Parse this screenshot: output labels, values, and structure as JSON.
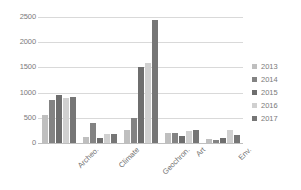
{
  "chart_data": {
    "type": "bar",
    "title": "",
    "subtitle": "",
    "xlabel": "",
    "ylabel": "",
    "categories": [
      "Archeo.",
      "Climate",
      "Geochron.",
      "Art",
      "Env."
    ],
    "series": [
      {
        "name": "2013",
        "color": "#bfbfbf",
        "values": [
          550,
          120,
          250,
          190,
          70
        ]
      },
      {
        "name": "2014",
        "color": "#838383",
        "values": [
          850,
          400,
          500,
          190,
          60
        ]
      },
      {
        "name": "2015",
        "color": "#6e6e6e",
        "values": [
          950,
          90,
          1500,
          130,
          90
        ]
      },
      {
        "name": "2016",
        "color": "#d0d0d0",
        "values": [
          900,
          170,
          1580,
          230,
          250
        ]
      },
      {
        "name": "2017",
        "color": "#767676",
        "values": [
          920,
          180,
          2450,
          250,
          150
        ]
      }
    ],
    "ylim": [
      0,
      2500
    ],
    "yticks": [
      0,
      500,
      1000,
      1500,
      2000,
      2500
    ],
    "ytick_labels": [
      "0",
      "500",
      "1000",
      "1500",
      "2000",
      "2500"
    ],
    "grid": true,
    "grid_axis": "y",
    "legend_position": "right",
    "annotations": []
  },
  "legend": {
    "entries": [
      {
        "label": "2013",
        "color": "#bfbfbf"
      },
      {
        "label": "2014",
        "color": "#838383"
      },
      {
        "label": "2015",
        "color": "#6e6e6e"
      },
      {
        "label": "2016",
        "color": "#d0d0d0"
      },
      {
        "label": "2017",
        "color": "#767676"
      }
    ]
  },
  "colors": {
    "background": "#ffffff",
    "grid": "#d9d9d9",
    "axis": "#bfbfbf",
    "tick_text": "#7a7a7a"
  }
}
